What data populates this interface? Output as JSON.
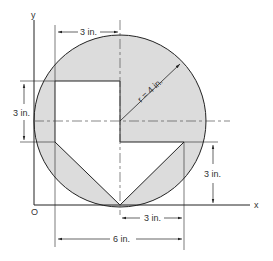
{
  "figure": {
    "axes": {
      "x_label": "x",
      "y_label": "y",
      "origin_label": "O"
    },
    "circle": {
      "radius_label": "r = 4 in.",
      "fill": "#dcdcdc",
      "stroke": "#222222"
    },
    "dimensions": {
      "top_width": "3 in.",
      "left_height": "3 in.",
      "right_height": "3 in.",
      "bottom_half": "3 in.",
      "bottom_full": "6 in."
    }
  }
}
